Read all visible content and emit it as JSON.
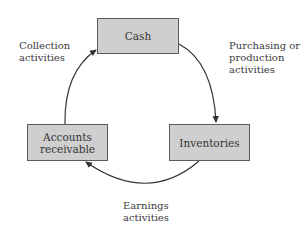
{
  "diagram": {
    "nodes": [
      {
        "id": "cash",
        "label": "Cash"
      },
      {
        "id": "accounts-receivable",
        "label": "Accounts\nreceivable"
      },
      {
        "id": "inventories",
        "label": "Inventories"
      }
    ],
    "edges": [
      {
        "from": "cash",
        "to": "inventories",
        "label": "Purchasing or\nproduction\nactivities"
      },
      {
        "from": "inventories",
        "to": "accounts-receivable",
        "label": "Earnings\nactivities"
      },
      {
        "from": "accounts-receivable",
        "to": "cash",
        "label": "Collection\nactivities"
      }
    ],
    "colors": {
      "box_fill": "#cfcfcf",
      "box_border": "#5a5a5a",
      "arrow": "#333333",
      "text": "#333333"
    }
  }
}
